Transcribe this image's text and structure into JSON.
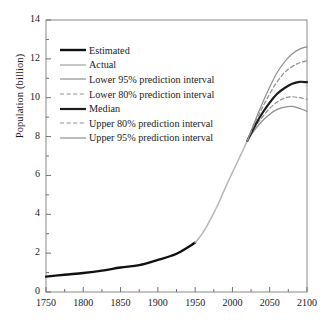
{
  "chart_data": {
    "type": "line",
    "title": "",
    "xlabel": "",
    "ylabel": "Population (billion)",
    "xlim": [
      1750,
      2100
    ],
    "ylim": [
      0,
      14
    ],
    "xticks": [
      1750,
      1800,
      1850,
      1900,
      1950,
      2000,
      2050,
      2100
    ],
    "yticks": [
      0,
      2,
      4,
      6,
      8,
      10,
      12,
      14
    ],
    "xtick_labels": [
      "1750",
      "1800",
      "1850",
      "1900",
      "1950",
      "2000",
      "2050",
      "2100"
    ],
    "ytick_labels": [
      "0",
      "2",
      "4",
      "6",
      "8",
      "10",
      "12",
      "14"
    ],
    "x_minor_step": 25,
    "y_minor_step": 1,
    "grid": false,
    "legend_position": "upper left",
    "series": [
      {
        "name": "Estimated",
        "style": "solid",
        "color": "#111111",
        "width": 2.4,
        "x": [
          1750,
          1775,
          1800,
          1825,
          1850,
          1875,
          1900,
          1925,
          1950
        ],
        "values": [
          0.79,
          0.89,
          0.98,
          1.1,
          1.26,
          1.38,
          1.65,
          1.97,
          2.54
        ]
      },
      {
        "name": "Actual",
        "style": "solid",
        "color": "#b4b4b4",
        "width": 1.5,
        "x": [
          1950,
          1960,
          1970,
          1980,
          1990,
          2000,
          2010,
          2020
        ],
        "values": [
          2.54,
          3.03,
          3.7,
          4.45,
          5.33,
          6.15,
          6.96,
          7.79
        ]
      },
      {
        "name": "Lower 95% prediction interval",
        "style": "solid",
        "color": "#8f8f8f",
        "width": 1.2,
        "x": [
          2020,
          2030,
          2040,
          2050,
          2060,
          2070,
          2080,
          2090,
          2100
        ],
        "values": [
          7.79,
          8.35,
          8.8,
          9.15,
          9.4,
          9.52,
          9.55,
          9.45,
          9.3
        ]
      },
      {
        "name": "Lower 80% prediction interval",
        "style": "dashed",
        "color": "#8f8f8f",
        "width": 1.2,
        "x": [
          2020,
          2030,
          2040,
          2050,
          2060,
          2070,
          2080,
          2090,
          2100
        ],
        "values": [
          7.79,
          8.45,
          9.0,
          9.45,
          9.78,
          9.98,
          10.05,
          10.0,
          9.92
        ]
      },
      {
        "name": "Median",
        "style": "solid",
        "color": "#1c1c1c",
        "width": 2.2,
        "x": [
          2020,
          2030,
          2040,
          2050,
          2060,
          2070,
          2080,
          2090,
          2100
        ],
        "values": [
          7.79,
          8.55,
          9.2,
          9.75,
          10.2,
          10.5,
          10.72,
          10.82,
          10.8
        ]
      },
      {
        "name": "Upper 80% prediction interval",
        "style": "dashed",
        "color": "#8f8f8f",
        "width": 1.2,
        "x": [
          2020,
          2030,
          2040,
          2050,
          2060,
          2070,
          2080,
          2090,
          2100
        ],
        "values": [
          7.79,
          8.68,
          9.48,
          10.2,
          10.82,
          11.3,
          11.6,
          11.8,
          11.9
        ]
      },
      {
        "name": "Upper 95% prediction interval",
        "style": "solid",
        "color": "#8f8f8f",
        "width": 1.2,
        "x": [
          2020,
          2030,
          2040,
          2050,
          2060,
          2070,
          2080,
          2090,
          2100
        ],
        "values": [
          7.79,
          8.78,
          9.7,
          10.55,
          11.3,
          11.85,
          12.25,
          12.5,
          12.62
        ]
      }
    ]
  }
}
